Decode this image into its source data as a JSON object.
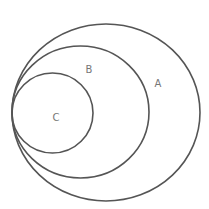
{
  "diagram": {
    "type": "nested-sets",
    "sets": [
      {
        "label": "A",
        "cx": 106,
        "cy": 112.5,
        "rx": 94,
        "ry": 88.5,
        "label_x": 158,
        "label_y": 84
      },
      {
        "label": "B",
        "cx": 80.5,
        "cy": 112,
        "rx": 68.5,
        "ry": 66,
        "label_x": 89,
        "label_y": 70
      },
      {
        "label": "C",
        "cx": 52.5,
        "cy": 113,
        "rx": 40.5,
        "ry": 40,
        "label_x": 56,
        "label_y": 118
      }
    ],
    "relationship": "C ⊂ B ⊂ A",
    "stroke_color": "#555555"
  }
}
